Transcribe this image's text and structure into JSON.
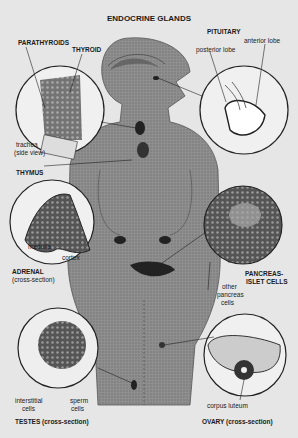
{
  "title": "ENDOCRINE GLANDS",
  "labels": {
    "pituitary": "PITUITARY",
    "posterior_lobe": "posterior lobe",
    "anterior_lobe": "anterior lobe",
    "parathyroids": "PARATHYROIDS",
    "thyroid": "THYROID",
    "trachea_1": "trachea",
    "trachea_2": "(side view)",
    "thymus": "THYMUS",
    "medulla": "medulla",
    "cortex": "cortex",
    "adrenal_1": "ADRENAL",
    "adrenal_2": "(cross-section)",
    "pancreas_1": "PANCREAS-",
    "pancreas_2": "ISLET CELLS",
    "other_pancreas_1": "other",
    "other_pancreas_2": "pancreas",
    "other_pancreas_3": "cells",
    "interstitial_1": "interstitial",
    "interstitial_2": "cells",
    "sperm_1": "sperm",
    "sperm_2": "cells",
    "testes": "TESTES (cross-section)",
    "corpus_luteum": "corpus luteum",
    "ovary": "OVARY (cross-section)"
  },
  "colors": {
    "background": "#e6e6e6",
    "body": "#9a9a9a",
    "gland": "#2a2a2a",
    "circle_fill": "#f2f2f2"
  }
}
